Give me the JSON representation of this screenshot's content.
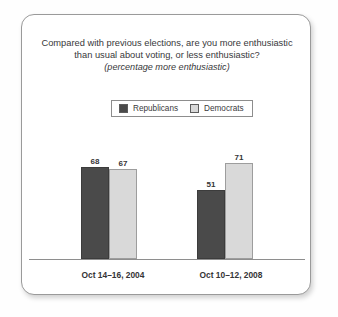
{
  "chart_data": {
    "type": "bar",
    "title": "Compared with previous elections, are you more enthusiastic than usual about voting, or less enthusiastic?",
    "subtitle": "(percentage more enthusiastic)",
    "categories": [
      "Oct 14–16, 2004",
      "Oct 10–12, 2008"
    ],
    "series": [
      {
        "name": "Republicans",
        "values": [
          68,
          51
        ],
        "color": "#4a4a4a"
      },
      {
        "name": "Democrats",
        "values": [
          67,
          71
        ],
        "color": "#d9d9d9"
      }
    ],
    "xlabel": "",
    "ylabel": "",
    "ylim": [
      0,
      80
    ],
    "grid": false,
    "legend_position": "top-center",
    "value_labels": true
  },
  "legend": {
    "entries": [
      {
        "label": "Republicans",
        "swatch": "legend-swatch-republicans"
      },
      {
        "label": "Democrats",
        "swatch": "legend-swatch-democrats"
      }
    ]
  }
}
